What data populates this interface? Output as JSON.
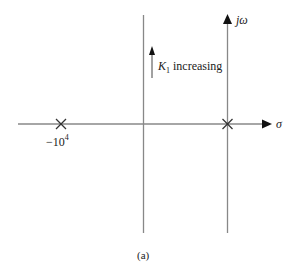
{
  "figure": {
    "caption": "(a)",
    "axes": {
      "x_label": "σ",
      "y_label": "jω"
    },
    "annotation": {
      "symbol": "K",
      "subscript": "1",
      "text": "increasing"
    },
    "poles": [
      {
        "label": "−10",
        "exponent": "4",
        "position": "left"
      },
      {
        "label": "",
        "position": "origin"
      }
    ],
    "colors": {
      "line": "#888888",
      "text": "#222222",
      "arrow": "#111111"
    }
  }
}
